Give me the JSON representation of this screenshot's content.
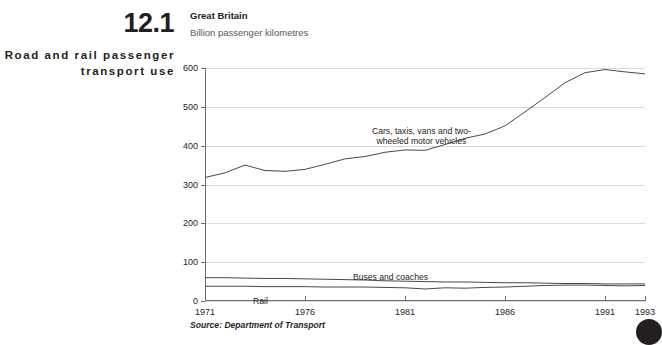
{
  "figure": {
    "number": "12.1",
    "title": "Road and rail passenger transport use"
  },
  "chart_panel": {
    "region": "Great Britain",
    "units": "Billion passenger kilometres",
    "source": "Source: Department of Transport"
  },
  "annotations": {
    "cars": "Cars, taxis, vans and two-\nwheeled motor vehicles",
    "buses": "Buses and coaches",
    "rail": "Rail"
  },
  "colors": {
    "line": "#4a4a4c",
    "grid": "#d9d9d9",
    "axis": "#6d6e71",
    "text": "#231f20",
    "muted_text": "#58585b"
  },
  "chart_data": {
    "type": "line",
    "title": "Road and rail passenger transport use",
    "subtitle": "Great Britain",
    "xlabel": "",
    "ylabel": "Billion passenger kilometres",
    "xlim": [
      1971,
      1993
    ],
    "ylim": [
      0,
      600
    ],
    "yticks": [
      0,
      100,
      200,
      300,
      400,
      500,
      600
    ],
    "xticks": [
      1971,
      1976,
      1981,
      1986,
      1991,
      1993
    ],
    "grid": true,
    "legend": "inline-annotations",
    "x": [
      1971,
      1972,
      1973,
      1974,
      1975,
      1976,
      1977,
      1978,
      1979,
      1980,
      1981,
      1982,
      1983,
      1984,
      1985,
      1986,
      1987,
      1988,
      1989,
      1990,
      1991,
      1992,
      1993
    ],
    "series": [
      {
        "name": "Cars, taxis, vans and two-wheeled motor vehicles",
        "values": [
          318,
          330,
          350,
          336,
          334,
          339,
          352,
          366,
          372,
          383,
          389,
          388,
          403,
          419,
          430,
          451,
          487,
          524,
          562,
          588,
          596,
          590,
          585
        ]
      },
      {
        "name": "Buses and coaches",
        "values": [
          60,
          60,
          59,
          58,
          58,
          57,
          56,
          55,
          54,
          52,
          51,
          50,
          49,
          49,
          48,
          47,
          47,
          46,
          45,
          45,
          44,
          44,
          44
        ]
      },
      {
        "name": "Rail",
        "values": [
          38,
          38,
          38,
          37,
          37,
          37,
          36,
          36,
          36,
          35,
          34,
          31,
          34,
          33,
          35,
          36,
          38,
          40,
          41,
          41,
          40,
          39,
          40
        ]
      }
    ]
  }
}
